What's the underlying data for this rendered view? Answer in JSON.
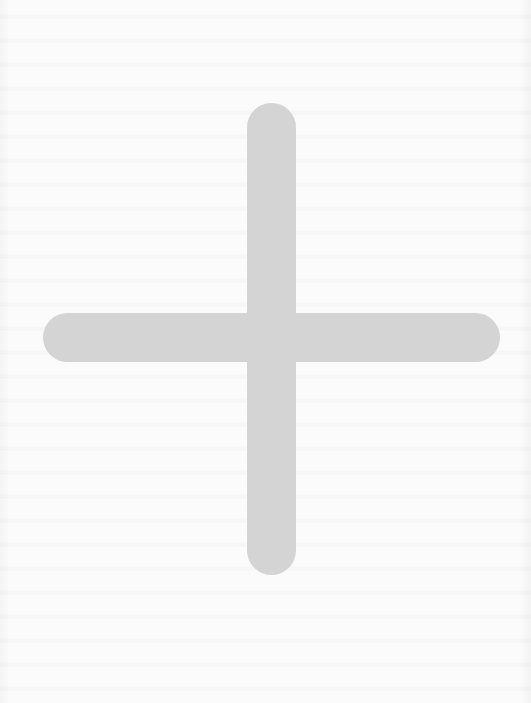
{
  "page": {
    "background_color": "#fbfbfb"
  },
  "plus_icon": {
    "icon": "plus-icon",
    "color": "#d4d4d4"
  }
}
